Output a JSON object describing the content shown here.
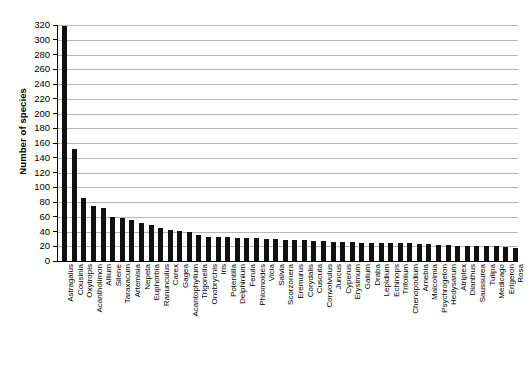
{
  "chart_data": {
    "type": "bar",
    "title": "",
    "xlabel": "",
    "ylabel": "Number of species",
    "ylim": [
      0,
      320
    ],
    "ytick_step": 20,
    "yticks": [
      0,
      20,
      40,
      60,
      80,
      100,
      120,
      140,
      160,
      180,
      200,
      220,
      240,
      260,
      280,
      300,
      320
    ],
    "grid": true,
    "legend": "none",
    "bar_color": "#111111",
    "gridline_color": "#b7b7b7",
    "axis_color": "#000000",
    "categories": [
      "Astragalus",
      "Cousinia",
      "Oxytropis",
      "Acantholimon",
      "Allium",
      "Silene",
      "Taraxacum",
      "Artemisia",
      "Nepeta",
      "Euphorbia",
      "Ranunculus",
      "Carex",
      "Gagea",
      "Acantophyllum",
      "Trigonella",
      "Onobrychis",
      "Iris",
      "Potentilla",
      "Delphinium",
      "Ferula",
      "Phlomoides",
      "Vicia",
      "Salvia",
      "Scorzonera",
      "Eremurus",
      "Corydalis",
      "Cuscuta",
      "Convolvulus",
      "Juncus",
      "Cyperus",
      "Erysimum",
      "Galium",
      "Draba",
      "Lepidium",
      "Echinops",
      "Trifolium",
      "Chenopodium",
      "Arnebia",
      "Malcolmia",
      "Psychrogeton",
      "Hedysarum",
      "Atriplex",
      "Dianthus",
      "Saussurea",
      "Tulipa",
      "Medicago",
      "Erigeron",
      "Rosa"
    ],
    "values": [
      318,
      152,
      86,
      75,
      72,
      60,
      58,
      56,
      51,
      49,
      45,
      42,
      41,
      40,
      35,
      33,
      32,
      32,
      31,
      31,
      31,
      30,
      30,
      29,
      29,
      28,
      27,
      27,
      26,
      26,
      26,
      25,
      25,
      25,
      24,
      24,
      24,
      23,
      23,
      22,
      22,
      21,
      21,
      20,
      20,
      20,
      19,
      18
    ]
  }
}
